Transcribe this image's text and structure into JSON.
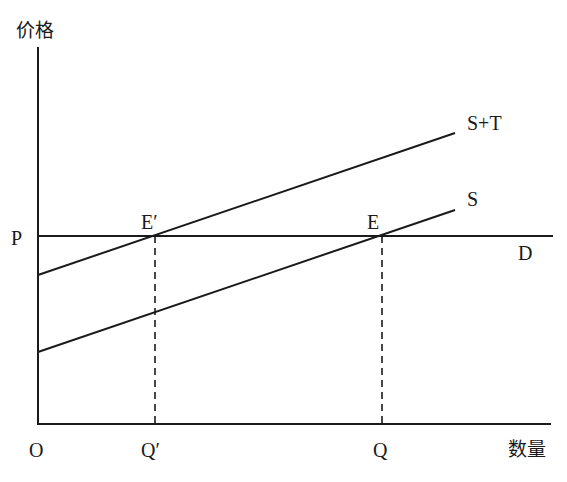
{
  "diagram": {
    "axes": {
      "y_label": "价格",
      "x_label": "数量",
      "origin_label": "O"
    },
    "price_label": "P",
    "curves": [
      {
        "id": "s_plus_t",
        "label": "S+T",
        "from": [
          38,
          275
        ],
        "to": [
          455,
          133
        ]
      },
      {
        "id": "s",
        "label": "S",
        "from": [
          38,
          352
        ],
        "to": [
          455,
          210
        ]
      },
      {
        "id": "d",
        "label": "D",
        "from": [
          38,
          236
        ],
        "to": [
          553,
          236
        ]
      }
    ],
    "points": [
      {
        "id": "e_prime",
        "label": "E′",
        "x": 155,
        "y": 236
      },
      {
        "id": "e",
        "label": "E",
        "x": 382,
        "y": 236
      }
    ],
    "quantity_labels": [
      {
        "id": "q_prime",
        "label": "Q′",
        "x": 155
      },
      {
        "id": "q",
        "label": "Q",
        "x": 382
      }
    ],
    "colors": {
      "line": "#1a1a1a",
      "background": "#ffffff"
    }
  }
}
